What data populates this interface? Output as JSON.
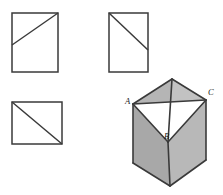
{
  "figure": {
    "background_color": "#ffffff",
    "stroke_color": "#3a3a3a",
    "face_fill_gray": "#b3b3b3",
    "face_fill_light": "#c4c4c4",
    "face_fill_dark": "#a8a8a8",
    "cut_fill_white": "#ffffff",
    "canvas": {
      "width": 223,
      "height": 195
    }
  },
  "views": {
    "top_left": {
      "name": "front view",
      "rect": {
        "x": 12,
        "y": 13,
        "width": 46,
        "height": 59
      },
      "diagonal": {
        "x1": 12,
        "y1": 45,
        "x2": 58,
        "y2": 13
      }
    },
    "top_right": {
      "name": "side view",
      "rect": {
        "x": 109,
        "y": 13,
        "width": 39,
        "height": 59
      },
      "diagonal": {
        "x1": 109,
        "y1": 13,
        "x2": 148,
        "y2": 50
      }
    },
    "bottom_left": {
      "name": "plan view",
      "rect": {
        "x": 12,
        "y": 102,
        "width": 50,
        "height": 42
      },
      "diagonal": {
        "x1": 12,
        "y1": 102,
        "x2": 62,
        "y2": 144
      }
    }
  },
  "prism": {
    "name": "pictorial view",
    "outline": "172,79 206,100 206,160 170,186 133,163 133,104",
    "top_face_left": "133,104 172,79 168,142",
    "top_face_right": "172,79 206,100 168,142",
    "cut_triangle": "133,104 206,100 168,142",
    "left_face": "133,104 168,142 170,186 133,163",
    "right_face": "168,142 206,100 206,160 170,186",
    "edges": [
      {
        "name": "edge-A-apex",
        "x1": 133,
        "y1": 104,
        "x2": 172,
        "y2": 79
      },
      {
        "name": "edge-apex-C",
        "x1": 172,
        "y1": 79,
        "x2": 206,
        "y2": 100
      },
      {
        "name": "edge-A-B",
        "x1": 133,
        "y1": 104,
        "x2": 168,
        "y2": 142
      },
      {
        "name": "edge-B-C",
        "x1": 168,
        "y1": 142,
        "x2": 206,
        "y2": 100
      },
      {
        "name": "edge-A-C",
        "x1": 133,
        "y1": 104,
        "x2": 206,
        "y2": 100
      },
      {
        "name": "edge-apex-B",
        "x1": 172,
        "y1": 79,
        "x2": 168,
        "y2": 142
      },
      {
        "name": "edge-A-left-bottom",
        "x1": 133,
        "y1": 104,
        "x2": 133,
        "y2": 163
      },
      {
        "name": "edge-C-right-bottom",
        "x1": 206,
        "y1": 100,
        "x2": 206,
        "y2": 160
      },
      {
        "name": "edge-B-bottom",
        "x1": 168,
        "y1": 142,
        "x2": 170,
        "y2": 186
      },
      {
        "name": "edge-bottom-left",
        "x1": 133,
        "y1": 163,
        "x2": 170,
        "y2": 186
      },
      {
        "name": "edge-bottom-right",
        "x1": 170,
        "y1": 186,
        "x2": 206,
        "y2": 160
      }
    ],
    "labels": [
      {
        "id": "label-A",
        "text": "A",
        "x": 125,
        "y": 104
      },
      {
        "id": "label-B",
        "text": "B",
        "x": 164,
        "y": 139
      },
      {
        "id": "label-C",
        "text": "C",
        "x": 208,
        "y": 95
      }
    ]
  }
}
